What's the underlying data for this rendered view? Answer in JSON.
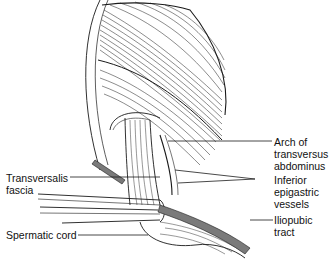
{
  "diagram": {
    "labels": [
      {
        "id": "arch",
        "text": "Arch of\ntransversus\nabdominus"
      },
      {
        "id": "inferior_epigastric",
        "text": "Inferior\nepigastric\nvessels"
      },
      {
        "id": "iliopubic",
        "text": "Iliopubic\ntract"
      },
      {
        "id": "transversalis",
        "text": "Transversalis\nfascia"
      },
      {
        "id": "spermatic",
        "text": "Spermatic cord"
      }
    ],
    "colors": {
      "line": "#1a1a1a",
      "vessel_fill": "#7a7a7a",
      "background": "#ffffff"
    }
  }
}
